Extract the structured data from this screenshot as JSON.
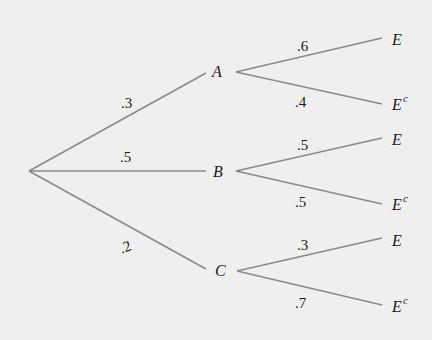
{
  "diagram": {
    "type": "probability-tree",
    "colors": {
      "background": "#efefef",
      "edge": "#8a8a8a",
      "text": "#1a1a1a"
    },
    "root": {
      "x": 29,
      "y": 171
    },
    "first_level": [
      {
        "label": "A",
        "prob": ".3",
        "x": 218,
        "y": 72,
        "children": [
          {
            "label": "E",
            "sup": "",
            "prob": ".6"
          },
          {
            "label": "E",
            "sup": "c",
            "prob": ".4"
          }
        ]
      },
      {
        "label": "B",
        "prob": ".5",
        "x": 220,
        "y": 172,
        "children": [
          {
            "label": "E",
            "sup": "",
            "prob": ".5"
          },
          {
            "label": "E",
            "sup": "c",
            "prob": ".5"
          }
        ]
      },
      {
        "label": "C",
        "prob": ".2",
        "x": 222,
        "y": 270,
        "children": [
          {
            "label": "E",
            "sup": "",
            "prob": ".3"
          },
          {
            "label": "E",
            "sup": "c",
            "prob": ".7"
          }
        ]
      }
    ]
  }
}
